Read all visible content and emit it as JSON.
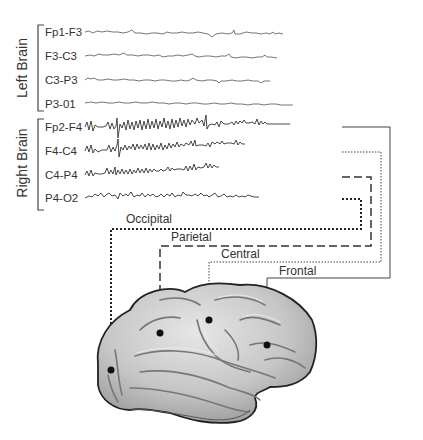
{
  "groups": [
    {
      "label": "Left Brain",
      "channels": [
        "Fp1-F3",
        "F3-C3",
        "C3-P3",
        "P3-01"
      ]
    },
    {
      "label": "Right Brain",
      "channels": [
        "Fp2-F4",
        "F4-C4",
        "C4-P4",
        "P4-O2"
      ]
    }
  ],
  "regions": {
    "occipital": "Occipital",
    "parietal": "Parietal",
    "central": "Central",
    "frontal": "Frontal"
  },
  "colors": {
    "trace": "#555555",
    "line": "#444444",
    "brain_fill": "#c9c9c9",
    "brain_outline": "#2a2a2a",
    "electrode": "#111111"
  }
}
